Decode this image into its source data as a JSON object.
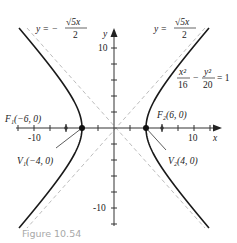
{
  "caption": "Figure 10.54",
  "chart_data": {
    "type": "line",
    "xlabel": "x",
    "ylabel": "y",
    "xlim": [
      -13,
      13
    ],
    "ylim": [
      -13,
      13
    ],
    "x_tick_labels": [
      "-10",
      "10"
    ],
    "y_tick_labels": [
      "10",
      "-10"
    ],
    "tick_spacing": 2,
    "grid": false,
    "equation": {
      "lhs_num1": "x²",
      "lhs_den1": "16",
      "minus": "−",
      "lhs_num2": "y²",
      "lhs_den2": "20",
      "rhs": "= 1"
    },
    "series": [
      {
        "name": "hyperbola",
        "style": "solid",
        "color": "#1a1a1a",
        "a": 4,
        "b": 4.472
      },
      {
        "name": "asymptote y = √5x/2",
        "style": "dashed",
        "color": "#b8b8b8",
        "slope": 1.118
      },
      {
        "name": "asymptote y = −√5x/2",
        "style": "dashed",
        "color": "#b8b8b8",
        "slope": -1.118
      }
    ],
    "asymptote_labels": {
      "left": {
        "prefix": "y = −",
        "num": "√5x",
        "den": "2"
      },
      "right": {
        "prefix": "y =",
        "num": "√5x",
        "den": "2"
      }
    },
    "points": [
      {
        "label": "F₁(−6, 0)",
        "x": -6,
        "y": 0,
        "type": "focus"
      },
      {
        "label": "F₂(6, 0)",
        "x": 6,
        "y": 0,
        "type": "focus"
      },
      {
        "label": "V₁(−4, 0)",
        "x": -4,
        "y": 0,
        "type": "vertex"
      },
      {
        "label": "V₂(4, 0)",
        "x": 4,
        "y": 0,
        "type": "vertex"
      }
    ]
  }
}
